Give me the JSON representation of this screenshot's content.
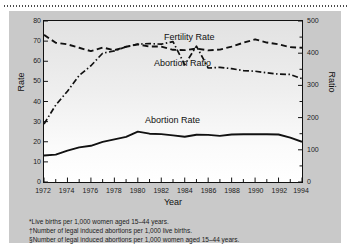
{
  "figure": {
    "panel_color": "#c9c9c9",
    "line_color": "#111111"
  },
  "axes": {
    "left_title": "Rate",
    "right_title": "Ratio",
    "x_title": "Year",
    "left_ticks": [
      "80",
      "70",
      "60",
      "50",
      "40",
      "30",
      "20",
      "10",
      "0"
    ],
    "right_ticks": [
      "500",
      "400",
      "300",
      "200",
      "100",
      "0"
    ],
    "x_ticks": [
      "1972",
      "1974",
      "1976",
      "1978",
      "1980",
      "1982",
      "1984",
      "1986",
      "1988",
      "1990",
      "1992",
      "1994"
    ]
  },
  "series_labels": {
    "fertility": "Fertility Rate",
    "ratio": "Abortion Ratio",
    "rate": "Abortion Rate"
  },
  "footnotes": [
    {
      "mark": "*",
      "text": "Live births per 1,000 women aged 15–44 years."
    },
    {
      "mark": "†",
      "text": "Number of legal induced abortions per 1,000 live births."
    },
    {
      "mark": "§",
      "text": "Number of legal induced abortions per 1,000 women aged 15–44 years."
    }
  ],
  "chart_data": {
    "type": "line",
    "title": "",
    "xlabel": "Year",
    "ylabel": "Rate",
    "y2label": "Ratio",
    "grid": false,
    "legend": "inline-annotations",
    "xlim": [
      1972,
      1994
    ],
    "ylim": [
      0,
      80
    ],
    "y2lim": [
      0,
      500
    ],
    "x": [
      1972,
      1973,
      1974,
      1975,
      1976,
      1977,
      1978,
      1979,
      1980,
      1981,
      1982,
      1983,
      1984,
      1985,
      1986,
      1987,
      1988,
      1989,
      1990,
      1991,
      1992,
      1993,
      1994
    ],
    "series": [
      {
        "name": "Fertility Rate",
        "axis": "left",
        "style": "dashed",
        "values": [
          73.1,
          69.2,
          68.4,
          66.7,
          65.0,
          66.8,
          65.5,
          67.2,
          68.4,
          67.3,
          67.3,
          65.7,
          65.5,
          66.3,
          65.4,
          65.8,
          67.3,
          69.2,
          70.9,
          69.3,
          68.4,
          67.0,
          66.7
        ]
      },
      {
        "name": "Abortion Ratio",
        "axis": "right",
        "style": "dash-dot",
        "values": [
          180,
          239,
          282,
          331,
          361,
          400,
          407,
          420,
          428,
          430,
          428,
          436,
          364,
          422,
          354,
          356,
          352,
          346,
          344,
          339,
          335,
          334,
          321
        ]
      },
      {
        "name": "Abortion Rate",
        "axis": "left",
        "style": "solid",
        "values": [
          13.2,
          13.6,
          15.6,
          17.2,
          18.0,
          19.9,
          21.2,
          22.4,
          25.0,
          24.0,
          23.8,
          23.2,
          22.5,
          23.5,
          23.4,
          22.9,
          23.6,
          23.7,
          23.7,
          23.7,
          23.6,
          22.0,
          20.0
        ]
      }
    ]
  }
}
